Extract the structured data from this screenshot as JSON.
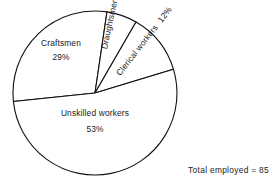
{
  "chart_data": {
    "type": "pie",
    "title": "",
    "subtitle": "",
    "xlabel": "",
    "ylabel": "",
    "legend": "none",
    "grid": false,
    "unit": "%",
    "annotation": "Total employed = 85",
    "total_label": "Total employed",
    "total_value": "85",
    "categories": [
      "Craftsmen",
      "Draughtsmen",
      "Clerical workers",
      "Unskilled workers"
    ],
    "values": [
      29,
      6,
      12,
      53
    ],
    "slices": [
      {
        "label": "Craftsmen",
        "percent_text": "29%",
        "value": 29,
        "start_angle": 174,
        "end_angle": 278.4,
        "fill": "#ffffff",
        "stroke": "#111111"
      },
      {
        "label": "Draughtsmen",
        "percent_text": "6%",
        "value": 6,
        "start_angle": 278.4,
        "end_angle": 300,
        "fill": "#ffffff",
        "stroke": "#111111"
      },
      {
        "label": "Clerical workers",
        "percent_text": "12%",
        "value": 12,
        "start_angle": 300,
        "end_angle": 343.2,
        "fill": "#ffffff",
        "stroke": "#111111"
      },
      {
        "label": "Unskilled workers",
        "percent_text": "53%",
        "value": 53,
        "start_angle": 343.2,
        "end_angle": 534,
        "fill": "#ffffff",
        "stroke": "#111111"
      }
    ],
    "geometry": {
      "center_x": 95,
      "center_y": 93,
      "radius": 82
    },
    "colors": {
      "background": "#ffffff",
      "outline": "#111111",
      "text": "#1a1a1a"
    }
  }
}
